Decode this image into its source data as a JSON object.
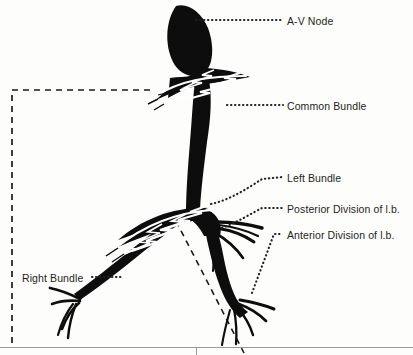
{
  "figure": {
    "ink_color": "#111111",
    "text_color": "#231f20",
    "background_color": "#fdfdfc",
    "rule_color": "#9a9a9a"
  },
  "labels": {
    "av_node": "A-V Node",
    "common_bundle": "Common Bundle",
    "left_bundle": "Left Bundle",
    "posterior_division": "Posterior Division of l.b.",
    "anterior_division": "Anterior Division of l.b.",
    "right_bundle": "Right Bundle"
  },
  "structures": [
    {
      "name": "a-v-node",
      "description": "Elongated solid black oval at top of figure"
    },
    {
      "name": "common-bundle",
      "description": "Thick black trunk descending from A-V node"
    },
    {
      "name": "left-bundle",
      "description": "Black branch descending to the right of the bifurcation"
    },
    {
      "name": "posterior-division",
      "description": "Fan of fibers from left bundle, upper right"
    },
    {
      "name": "anterior-division",
      "description": "Fan of fibers from left bundle, lower right"
    },
    {
      "name": "right-bundle",
      "description": "Black branch sweeping left and down, ending in a fan of fibers"
    },
    {
      "name": "upper-purkinje-fan",
      "description": "White zig-zag fiber spray at the A-V node junction"
    },
    {
      "name": "lower-purkinje-fan",
      "description": "White zig-zag fiber spray at the bifurcation"
    }
  ],
  "guides": [
    {
      "name": "left-dashed-guide",
      "description": "Dashed line from upper purkinje fan left then down the left margin"
    },
    {
      "name": "diagonal-dashed-guide",
      "description": "Dashed line from bifurcation down to the bottom rule"
    }
  ]
}
